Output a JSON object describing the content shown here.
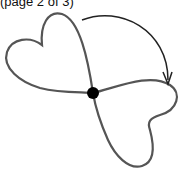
{
  "caption": "(page 2 of 3)",
  "figure": {
    "colors": {
      "curve": "#555555",
      "dot": "#000000",
      "arrow": "#222222"
    }
  }
}
